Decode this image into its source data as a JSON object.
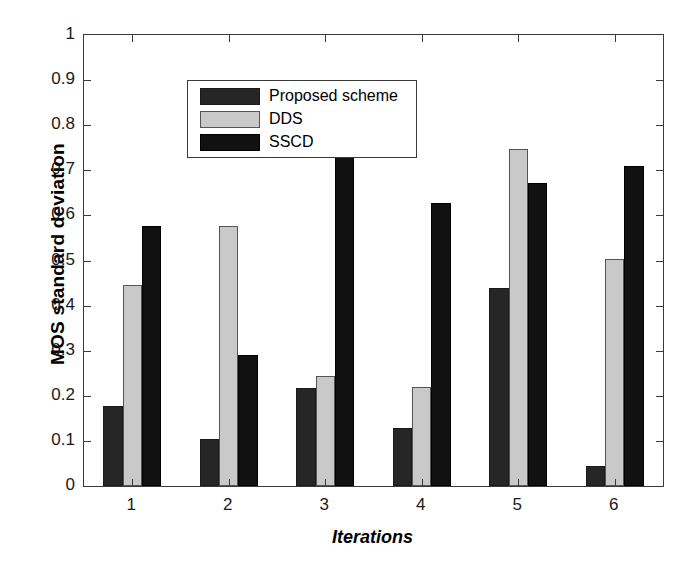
{
  "chart_data": {
    "type": "bar",
    "title": "",
    "subtitle": "",
    "xlabel": "Iterations",
    "ylabel": "MOS standard deviation",
    "categories": [
      "1",
      "2",
      "3",
      "4",
      "5",
      "6"
    ],
    "series": [
      {
        "name": "Proposed scheme",
        "color": "#262626",
        "values": [
          0.178,
          0.104,
          0.218,
          0.129,
          0.438,
          0.045
        ]
      },
      {
        "name": "DDS",
        "color": "#c9c9c9",
        "values": [
          0.445,
          0.577,
          0.244,
          0.219,
          0.748,
          0.503
        ]
      },
      {
        "name": "SSCD",
        "color": "#111111",
        "values": [
          0.577,
          0.291,
          0.797,
          0.628,
          0.672,
          0.71
        ]
      }
    ],
    "ylim": [
      0,
      1
    ],
    "yticks": [
      "0",
      "0.1",
      "0.2",
      "0.3",
      "0.4",
      "0.5",
      "0.6",
      "0.7",
      "0.8",
      "0.9",
      "1"
    ],
    "ytick_values": [
      0,
      0.1,
      0.2,
      0.3,
      0.4,
      0.5,
      0.6,
      0.7,
      0.8,
      0.9,
      1
    ],
    "xticks": [
      "1",
      "2",
      "3",
      "4",
      "5",
      "6"
    ],
    "grid": false,
    "legend_position": "upper-left",
    "legend_entries": [
      "Proposed scheme",
      "DDS",
      "SSCD"
    ]
  }
}
